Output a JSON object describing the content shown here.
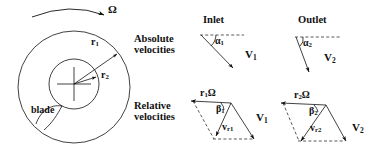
{
  "figure": {
    "background_color": "#ffffff",
    "line_color": "#111111",
    "width": 376,
    "height": 151
  },
  "rotor": {
    "rotation_symbol": "Ω",
    "radius_outer_label": "r",
    "radius_outer_sub": "1",
    "radius_inner_label": "r",
    "radius_inner_sub": "2",
    "blade_label": "blade",
    "outer_circle": {
      "cx": 74,
      "cy": 87,
      "r": 56
    },
    "inner_circle": {
      "cx": 74,
      "cy": 84,
      "r": 25
    }
  },
  "row_labels": {
    "absolute_line1": "Absolute",
    "absolute_line2": "velocities",
    "relative_line1": "Relative",
    "relative_line2": "velocities"
  },
  "columns": {
    "inlet": "Inlet",
    "outlet": "Outlet"
  },
  "absolute": {
    "inlet": {
      "angle_label": "α",
      "angle_sub": "1",
      "vector_label": "V",
      "vector_sub": "1"
    },
    "outlet": {
      "angle_label": "α",
      "angle_sub": "2",
      "vector_label": "V",
      "vector_sub": "2"
    }
  },
  "relative": {
    "inlet": {
      "blade_speed_label": "r",
      "blade_speed_sub": "1",
      "blade_speed_omega": "Ω",
      "angle_label": "β",
      "angle_sub": "1",
      "relative_label": "v",
      "relative_sub": "r1",
      "absolute_label": "V",
      "absolute_sub": "1"
    },
    "outlet": {
      "blade_speed_label": "r",
      "blade_speed_sub": "2",
      "blade_speed_omega": "Ω",
      "angle_label": "β",
      "angle_sub": "2",
      "relative_label": "v",
      "relative_sub": "r2",
      "absolute_label": "V",
      "absolute_sub": "2"
    }
  }
}
